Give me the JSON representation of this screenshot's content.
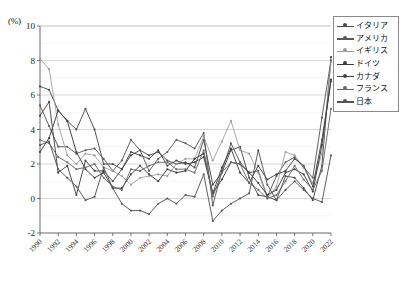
{
  "axes": {
    "y_unit_label": "(%)",
    "y_ticks": [
      "10",
      "8",
      "6",
      "4",
      "2",
      "0",
      "-2"
    ],
    "x_ticks": [
      "1990",
      "1992",
      "1994",
      "1996",
      "1998",
      "2000",
      "2002",
      "2004",
      "2006",
      "2008",
      "2010",
      "2012",
      "2014",
      "2016",
      "2018",
      "2020",
      "2022"
    ]
  },
  "legend": {
    "items": [
      {
        "label": "イタリア",
        "color": "#4a4a4a"
      },
      {
        "label": "アメリカ",
        "color": "#5a5a5a"
      },
      {
        "label": "イギリス",
        "color": "#9a9a9a"
      },
      {
        "label": "ドイツ",
        "color": "#3c3c3c"
      },
      {
        "label": "カナダ",
        "color": "#444444"
      },
      {
        "label": "フランス",
        "color": "#6a6a6a"
      },
      {
        "label": "日本",
        "color": "#555555"
      }
    ]
  },
  "chart_data": {
    "type": "line",
    "title": "",
    "xlabel": "",
    "ylabel": "(%)",
    "ylim": [
      -2,
      10
    ],
    "xlim": [
      1990,
      2022
    ],
    "grid": true,
    "legend_position": "top-right",
    "x": [
      1990,
      1991,
      1992,
      1993,
      1994,
      1995,
      1996,
      1997,
      1998,
      1999,
      2000,
      2001,
      2002,
      2003,
      2004,
      2005,
      2006,
      2007,
      2008,
      2009,
      2010,
      2011,
      2012,
      2013,
      2014,
      2015,
      2016,
      2017,
      2018,
      2019,
      2020,
      2021,
      2022
    ],
    "series": [
      {
        "name": "イタリア",
        "color": "#4a4a4a",
        "values": [
          6.5,
          6.3,
          5.1,
          4.5,
          4.0,
          5.2,
          4.0,
          2.0,
          2.0,
          1.7,
          2.5,
          2.8,
          2.5,
          2.7,
          2.2,
          2.0,
          2.1,
          1.8,
          3.4,
          0.8,
          1.5,
          2.8,
          3.0,
          1.2,
          0.2,
          0.1,
          -0.1,
          1.3,
          1.2,
          0.6,
          -0.1,
          1.9,
          8.2
        ]
      },
      {
        "name": "アメリカ",
        "color": "#5a5a5a",
        "values": [
          5.4,
          4.2,
          3.0,
          3.0,
          2.6,
          2.8,
          2.9,
          2.3,
          1.6,
          2.2,
          3.4,
          2.8,
          1.6,
          2.3,
          2.7,
          3.4,
          3.2,
          2.9,
          3.8,
          -0.4,
          1.6,
          3.2,
          2.1,
          1.5,
          1.6,
          0.1,
          1.3,
          2.1,
          2.4,
          1.8,
          1.2,
          4.7,
          8.0
        ]
      },
      {
        "name": "イギリス",
        "color": "#9a9a9a",
        "values": [
          8.1,
          7.5,
          4.3,
          2.5,
          2.0,
          2.6,
          2.5,
          1.8,
          1.6,
          1.3,
          0.8,
          1.2,
          1.3,
          1.4,
          1.3,
          2.0,
          2.3,
          2.3,
          3.6,
          2.2,
          3.3,
          4.5,
          2.8,
          2.6,
          1.5,
          0.0,
          0.7,
          2.7,
          2.5,
          1.8,
          0.9,
          2.6,
          7.9
        ]
      },
      {
        "name": "ドイツ",
        "color": "#3c3c3c",
        "values": [
          2.7,
          3.5,
          5.1,
          4.5,
          2.7,
          1.7,
          1.2,
          1.5,
          0.6,
          0.6,
          1.4,
          1.9,
          1.4,
          1.0,
          1.7,
          1.5,
          1.6,
          2.3,
          2.6,
          0.3,
          1.1,
          2.1,
          2.0,
          1.5,
          0.9,
          0.2,
          0.5,
          1.5,
          1.7,
          1.4,
          0.4,
          3.1,
          6.9
        ]
      },
      {
        "name": "カナダ",
        "color": "#444444",
        "values": [
          4.8,
          5.6,
          1.5,
          1.9,
          0.2,
          2.2,
          1.6,
          1.6,
          1.0,
          1.7,
          2.7,
          2.5,
          2.3,
          2.8,
          1.9,
          2.2,
          2.0,
          2.1,
          2.4,
          0.3,
          1.8,
          2.9,
          1.5,
          0.9,
          1.9,
          1.1,
          1.4,
          1.6,
          2.3,
          1.9,
          0.7,
          3.4,
          6.8
        ]
      },
      {
        "name": "フランス",
        "color": "#6a6a6a",
        "values": [
          3.4,
          3.2,
          2.4,
          2.1,
          1.7,
          1.8,
          2.0,
          1.2,
          0.7,
          0.5,
          1.7,
          1.6,
          1.9,
          2.1,
          2.1,
          1.7,
          1.7,
          1.5,
          2.8,
          0.1,
          1.5,
          2.1,
          2.0,
          0.9,
          0.5,
          0.0,
          0.2,
          1.0,
          1.9,
          1.1,
          0.5,
          1.6,
          5.2
        ]
      },
      {
        "name": "日本",
        "color": "#555555",
        "values": [
          3.1,
          3.3,
          1.7,
          1.2,
          0.7,
          -0.1,
          0.1,
          1.8,
          0.6,
          -0.3,
          -0.7,
          -0.7,
          -0.9,
          -0.3,
          0.0,
          -0.3,
          0.2,
          0.1,
          1.4,
          -1.3,
          -0.7,
          -0.3,
          0.0,
          0.3,
          2.8,
          0.8,
          -0.1,
          0.5,
          1.0,
          0.5,
          0.0,
          -0.2,
          2.5
        ]
      }
    ]
  }
}
